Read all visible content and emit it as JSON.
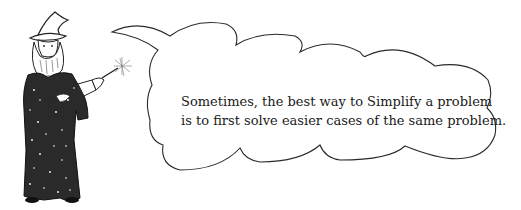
{
  "illustration": {
    "character": "wizard",
    "icon": "wizard-with-wand-icon"
  },
  "speech_bubble": {
    "lines": [
      "Sometimes, the best way to Simplify a problem",
      "is to first solve easier cases of the same problem."
    ]
  },
  "colors": {
    "ink": "#1a1a1a",
    "background": "#ffffff"
  }
}
